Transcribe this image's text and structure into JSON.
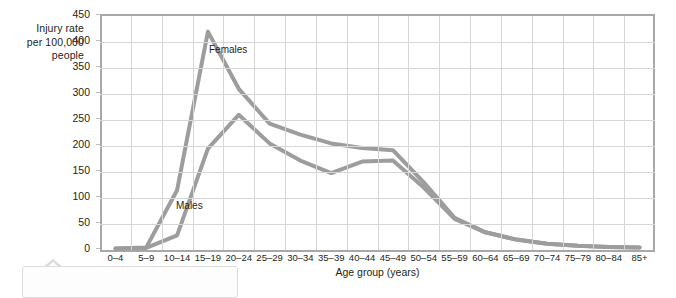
{
  "chart_data": {
    "type": "line",
    "title": "",
    "xlabel": "Age group (years)",
    "ylabel": "Injury rate per 100,000 people",
    "ylabel_lines": [
      "Injury rate",
      "per 100,000",
      "people"
    ],
    "ylim": [
      0,
      450
    ],
    "yticks": [
      0,
      50,
      100,
      150,
      200,
      250,
      300,
      350,
      400,
      450
    ],
    "grid": true,
    "legend_position": "inline-annotations",
    "categories": [
      "0–4",
      "5–9",
      "10–14",
      "15–19",
      "20–24",
      "25–29",
      "30–34",
      "35–39",
      "40–44",
      "45–49",
      "50–54",
      "55–59",
      "60–64",
      "65–69",
      "70–74",
      "75–79",
      "80–84",
      "85+"
    ],
    "series": [
      {
        "name": "Females",
        "color": "#9d9d9d",
        "values": [
          3,
          5,
          115,
          420,
          310,
          243,
          222,
          205,
          196,
          192,
          130,
          62,
          34,
          20,
          12,
          8,
          6,
          5
        ]
      },
      {
        "name": "Males",
        "color": "#9d9d9d",
        "values": [
          3,
          4,
          28,
          195,
          260,
          205,
          172,
          148,
          170,
          172,
          120,
          60,
          34,
          20,
          12,
          8,
          6,
          5
        ]
      }
    ],
    "annotations": [
      {
        "text": "Females",
        "series": "Females"
      },
      {
        "text": "Males",
        "series": "Males"
      }
    ],
    "colors": {
      "line": "#9d9d9d",
      "grid": "#d6d6d6",
      "axis": "#a8a8a8",
      "text": "#231f20",
      "background": "#ffffff"
    }
  },
  "callout": {
    "text": ""
  }
}
